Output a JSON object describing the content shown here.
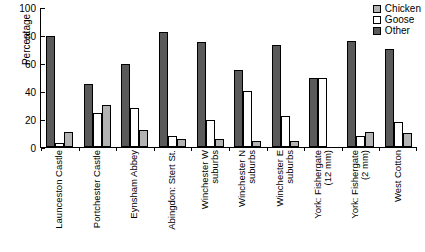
{
  "chart_data": {
    "type": "bar",
    "title": "",
    "xlabel": "",
    "ylabel": "Percentage",
    "ylim": [
      0,
      100
    ],
    "yticks": [
      0,
      20,
      40,
      60,
      80,
      100
    ],
    "grid": false,
    "legend_position": "top-right",
    "categories": [
      "Launceston Castle",
      "Portchester Castle",
      "Eynsham Abbey",
      "Abingdon: Stert St.",
      "Winchester W suburbs",
      "Winchester N suburbs",
      "Winchester E suburbs",
      "York: Fishergate (12 mm)",
      "York: Fishergate (2 mm)",
      "West Cotton"
    ],
    "category_lines": [
      [
        "Launceston Castle"
      ],
      [
        "Portchester Castle"
      ],
      [
        "Eynsham Abbey"
      ],
      [
        "Abingdon: Stert St."
      ],
      [
        "Winchester W",
        "suburbs"
      ],
      [
        "Winchester N",
        "suburbs"
      ],
      [
        "Winchester E",
        "suburbs"
      ],
      [
        "York: Fishergate",
        "(12 mm)"
      ],
      [
        "York: Fishergate",
        "(2 mm)"
      ],
      [
        "West Cotton"
      ]
    ],
    "series": [
      {
        "name": "Other",
        "color": "#5a5a5a",
        "values": [
          79,
          45,
          59,
          82,
          75,
          55,
          73,
          49,
          76,
          70
        ]
      },
      {
        "name": "Goose",
        "color": "#ffffff",
        "values": [
          3,
          24,
          28,
          8,
          19,
          40,
          22,
          49,
          8,
          18
        ]
      },
      {
        "name": "Chicken",
        "color": "#b3b3b3",
        "values": [
          11,
          30,
          12,
          6,
          6,
          4,
          4,
          0,
          11,
          10
        ]
      }
    ],
    "bar_order_in_group": [
      "Other",
      "Goose",
      "Chicken"
    ]
  },
  "legend": {
    "items": [
      {
        "label": "Chicken",
        "swatch": "chicken-swatch"
      },
      {
        "label": "Goose",
        "swatch": "goose-swatch"
      },
      {
        "label": "Other",
        "swatch": "other-swatch"
      }
    ]
  }
}
